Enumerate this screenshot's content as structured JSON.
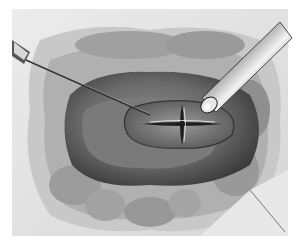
{
  "illustration": {
    "subject": "surgical cavity with needle and probe instrument",
    "elements": [
      "tissue-background",
      "cavity",
      "cruciate-incision",
      "needle",
      "probe-instrument"
    ],
    "palette": {
      "background": "#ffffff",
      "tissue_light": "#e4e4e4",
      "tissue_mid": "#a8a8a8",
      "tissue_dark": "#4a4a4a",
      "instrument_light": "#f0f0f0",
      "instrument_dark": "#3a3a3a"
    }
  }
}
